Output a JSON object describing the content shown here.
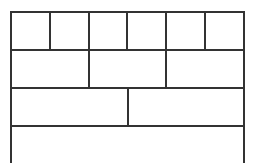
{
  "diagram": {
    "type": "fraction-wall",
    "line_color": "#333333",
    "rows": [
      {
        "label": "sixths",
        "cells": 6
      },
      {
        "label": "thirds",
        "cells": 3
      },
      {
        "label": "halves",
        "cells": 2
      },
      {
        "label": "whole",
        "cells": 1
      }
    ]
  }
}
